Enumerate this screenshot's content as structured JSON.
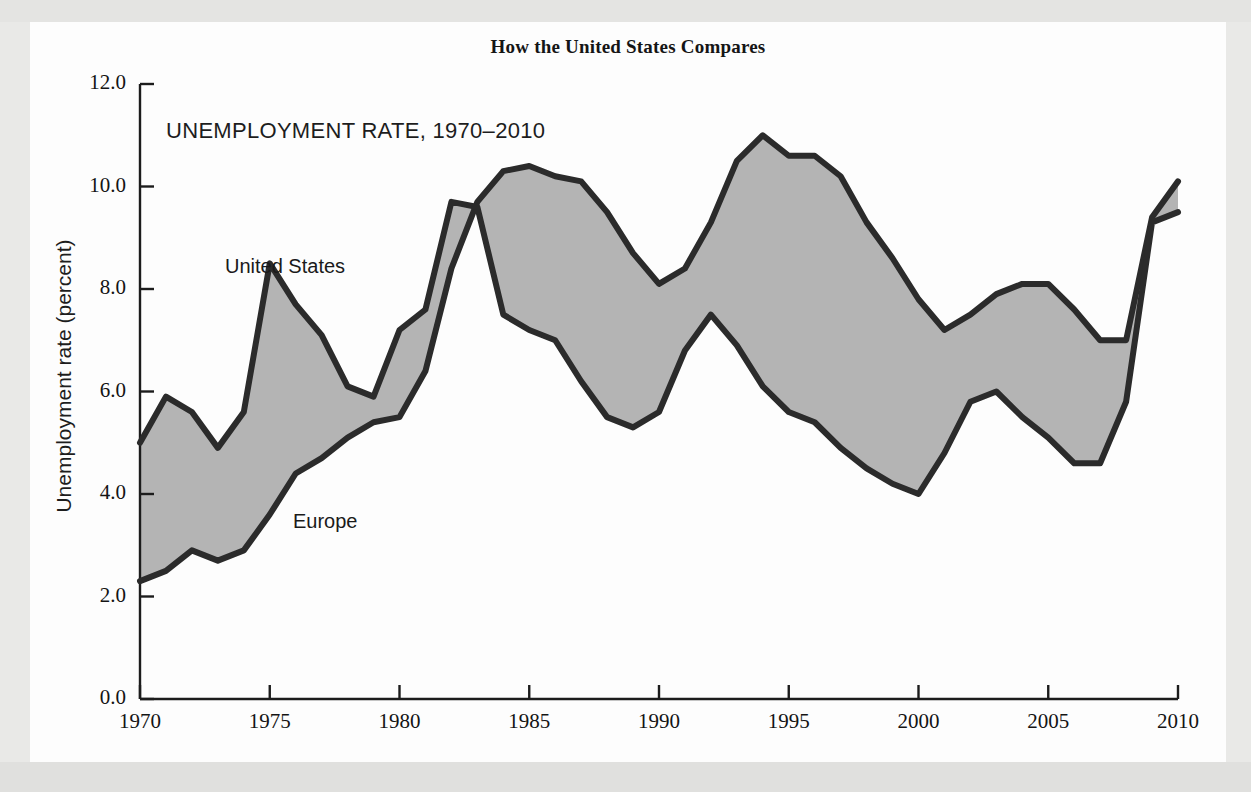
{
  "figure": {
    "title": "How the United States Compares",
    "subtitle": "UNEMPLOYMENT RATE, 1970–2010"
  },
  "chart_data": {
    "type": "area",
    "title": "How the United States Compares",
    "subtitle": "UNEMPLOYMENT RATE, 1970–2010",
    "xlabel": "",
    "ylabel": "Unemployment rate (percent)",
    "xlim": [
      1970,
      2010
    ],
    "ylim": [
      0.0,
      12.0
    ],
    "ytick_labels": [
      "0.0",
      "2.0",
      "4.0",
      "6.0",
      "8.0",
      "10.0",
      "12.0"
    ],
    "ytick_values": [
      0.0,
      2.0,
      4.0,
      6.0,
      8.0,
      10.0,
      12.0
    ],
    "xtick_labels": [
      "1970",
      "1975",
      "1980",
      "1985",
      "1990",
      "1995",
      "2000",
      "2005",
      "2010"
    ],
    "xtick_values": [
      1970,
      1975,
      1980,
      1985,
      1990,
      1995,
      2000,
      2005,
      2010
    ],
    "grid": false,
    "legend": "inline-annotations",
    "fill_between": true,
    "fill_color": "#b4b4b4",
    "line_color": "#2b2b2b",
    "x": [
      1970,
      1971,
      1972,
      1973,
      1974,
      1975,
      1976,
      1977,
      1978,
      1979,
      1980,
      1981,
      1982,
      1983,
      1984,
      1985,
      1986,
      1987,
      1988,
      1989,
      1990,
      1991,
      1992,
      1993,
      1994,
      1995,
      1996,
      1997,
      1998,
      1999,
      2000,
      2001,
      2002,
      2003,
      2004,
      2005,
      2006,
      2007,
      2008,
      2009,
      2010
    ],
    "series": [
      {
        "name": "United States",
        "label": "United States",
        "values": [
          5.0,
          5.9,
          5.6,
          4.9,
          5.6,
          8.5,
          7.7,
          7.1,
          6.1,
          5.9,
          7.2,
          7.6,
          9.7,
          9.6,
          7.5,
          7.2,
          7.0,
          6.2,
          5.5,
          5.3,
          5.6,
          6.8,
          7.5,
          6.9,
          6.1,
          5.6,
          5.4,
          4.9,
          4.5,
          4.2,
          4.0,
          4.8,
          5.8,
          6.0,
          5.5,
          5.1,
          4.6,
          4.6,
          5.8,
          9.3,
          9.5
        ]
      },
      {
        "name": "Europe",
        "label": "Europe",
        "values": [
          2.3,
          2.5,
          2.9,
          2.7,
          2.9,
          3.6,
          4.4,
          4.7,
          5.1,
          5.4,
          5.5,
          6.4,
          8.4,
          9.7,
          10.3,
          10.4,
          10.2,
          10.1,
          9.5,
          8.7,
          8.1,
          8.4,
          9.3,
          10.5,
          11.0,
          10.6,
          10.6,
          10.2,
          9.3,
          8.6,
          7.8,
          7.2,
          7.5,
          7.9,
          8.1,
          8.1,
          7.6,
          7.0,
          7.0,
          9.4,
          10.1
        ]
      }
    ]
  },
  "annotations": [
    {
      "name": "united-states-label",
      "text": "United States",
      "x_px": 195,
      "y_px": 233
    },
    {
      "name": "europe-label",
      "text": "Europe",
      "x_px": 263,
      "y_px": 488
    }
  ]
}
